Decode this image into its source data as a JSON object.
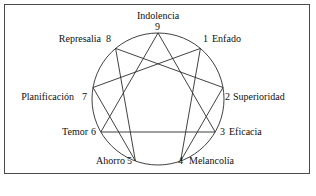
{
  "figure": {
    "border_color": "#4a4a4a",
    "line_color": "#2b2b2b",
    "background": "#ffffff"
  },
  "diagram": {
    "type": "enneagram",
    "circle": {
      "cx": 158,
      "cy": 99,
      "r": 66
    },
    "triangle_points": [
      9,
      3,
      6
    ],
    "hexad_sequence": [
      1,
      4,
      2,
      8,
      5,
      7,
      1
    ],
    "points": [
      {
        "number": "1",
        "label": "Enfado",
        "angle_deg": -50,
        "x": 200.4,
        "y": 48.4,
        "num_x": 203,
        "num_y": 35,
        "lbl_x": 211,
        "lbl_y": 35,
        "side": "right"
      },
      {
        "number": "2",
        "label": "Superioridad",
        "angle_deg": -10,
        "x": 223.0,
        "y": 87.5,
        "num_x": 226,
        "num_y": 92,
        "lbl_x": 233,
        "lbl_y": 92,
        "side": "right"
      },
      {
        "number": "3",
        "label": "Eficacia",
        "angle_deg": 30,
        "x": 215.2,
        "y": 132.0,
        "num_x": 221,
        "num_y": 131,
        "lbl_x": 229,
        "lbl_y": 131,
        "side": "right"
      },
      {
        "number": "4",
        "label": "Melancolía",
        "angle_deg": 70,
        "x": 180.6,
        "y": 161.0,
        "num_x": 179,
        "num_y": 160,
        "lbl_x": 190,
        "lbl_y": 160,
        "side": "right"
      },
      {
        "number": "5",
        "label": "Ahorro",
        "angle_deg": 110,
        "x": 135.4,
        "y": 161.0,
        "num_x": 128,
        "num_y": 160,
        "lbl_x": 92,
        "lbl_y": 160,
        "side": "left"
      },
      {
        "number": "6",
        "label": "Temor",
        "angle_deg": 150,
        "x": 100.8,
        "y": 132.0,
        "num_x": 92,
        "num_y": 131,
        "lbl_x": 60,
        "lbl_y": 131,
        "side": "left"
      },
      {
        "number": "7",
        "label": "Planificación",
        "angle_deg": 190,
        "x": 93.0,
        "y": 87.5,
        "num_x": 85,
        "num_y": 92,
        "lbl_x": 12,
        "lbl_y": 92,
        "side": "left"
      },
      {
        "number": "8",
        "label": "Represalia",
        "angle_deg": 230,
        "x": 115.6,
        "y": 48.4,
        "num_x": 110,
        "num_y": 35,
        "lbl_x": 59,
        "lbl_y": 35,
        "side": "left"
      },
      {
        "number": "9",
        "label": "Indolencia",
        "angle_deg": 270,
        "x": 158.0,
        "y": 33.0,
        "num_x": 155,
        "num_y": 23,
        "lbl_x": 131,
        "lbl_y": 12,
        "side": "top"
      }
    ]
  }
}
